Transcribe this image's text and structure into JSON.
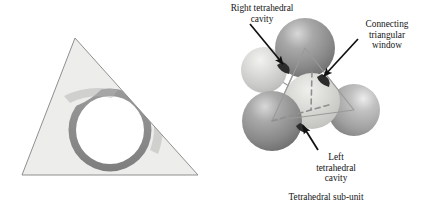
{
  "figure": {
    "caption": "Tetrahedral sub-unit",
    "panels": [
      {
        "name": "triangular-face-panel",
        "description": "triangular face with connecting window"
      },
      {
        "name": "tetrahedral-subunit-panel",
        "description": "five-sphere tetrahedral sub-unit"
      }
    ]
  },
  "labels": {
    "right_cavity": "Right tetrahedral\ncavity",
    "connecting_window": "Connecting\ntriangular\nwindow",
    "left_cavity": "Left\ntetrahedral\ncavity",
    "subunit_caption": "Tetrahedral sub-unit"
  },
  "colors": {
    "triangle_fill": "#ededeb",
    "triangle_stroke": "#8f8f8f",
    "band_dark": "#8c8c8c",
    "band_mid": "#a8a8a8",
    "window_white": "#ffffff",
    "sphere_dark": "#8e8e8e",
    "sphere_mid": "#b0b0b0",
    "sphere_light": "#cfcfcf",
    "wire_stroke": "#9a9a9a",
    "arrow_black": "#111111",
    "text": "#141414"
  },
  "geometry": {
    "triangle_apex": [
      75,
      38
    ],
    "triangle_left": [
      22,
      175
    ],
    "triangle_right": [
      198,
      175
    ],
    "window_center": [
      110,
      130
    ],
    "window_radius": 34,
    "spheres": [
      {
        "name": "sphere-top-dark",
        "cx": 305,
        "cy": 48,
        "r": 30,
        "tone": "dark"
      },
      {
        "name": "sphere-upper-left",
        "cx": 264,
        "cy": 70,
        "r": 23,
        "tone": "light"
      },
      {
        "name": "sphere-center",
        "cx": 312,
        "cy": 101,
        "r": 28,
        "tone": "light"
      },
      {
        "name": "sphere-lower-left",
        "cx": 272,
        "cy": 121,
        "r": 30,
        "tone": "dark"
      },
      {
        "name": "sphere-right",
        "cx": 354,
        "cy": 110,
        "r": 26,
        "tone": "mid"
      }
    ]
  }
}
